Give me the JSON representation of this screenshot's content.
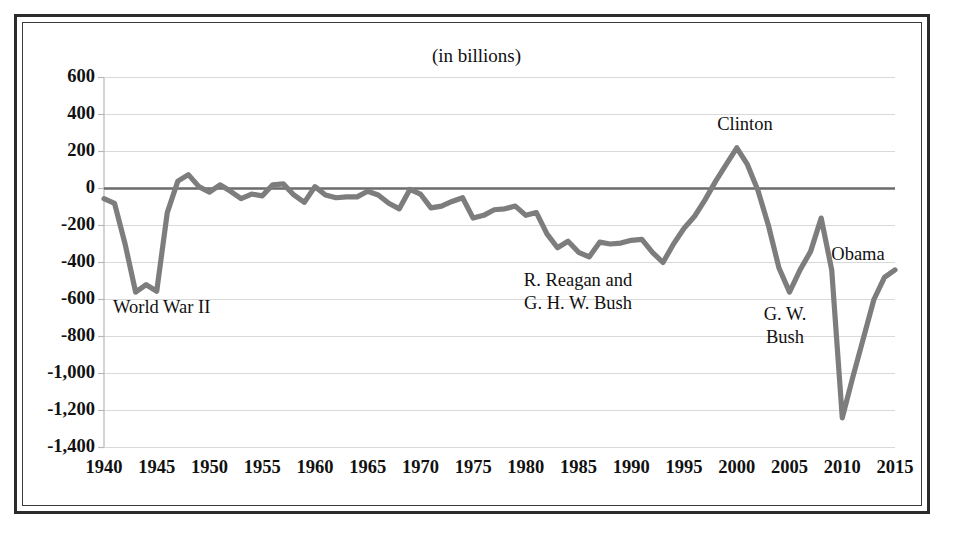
{
  "chart_data": {
    "type": "line",
    "title": "(in billions)",
    "xlabel": "",
    "ylabel": "",
    "xlim": [
      1940,
      2015
    ],
    "ylim": [
      -1400,
      600
    ],
    "grid": true,
    "legend": "none",
    "ytick_labels": [
      "600",
      "400",
      "200",
      "0",
      "-200",
      "-400",
      "-600",
      "-800",
      "-1,000",
      "-1,200",
      "-1,400"
    ],
    "ytick_values": [
      600,
      400,
      200,
      0,
      -200,
      -400,
      -600,
      -800,
      -1000,
      -1200,
      -1400
    ],
    "xtick_labels": [
      "1940",
      "1945",
      "1950",
      "1955",
      "1960",
      "1965",
      "1970",
      "1975",
      "1980",
      "1985",
      "1990",
      "1995",
      "2000",
      "2005",
      "2010",
      "2015"
    ],
    "xtick_values": [
      1940,
      1945,
      1950,
      1955,
      1960,
      1965,
      1970,
      1975,
      1980,
      1985,
      1990,
      1995,
      2000,
      2005,
      2010,
      2015
    ],
    "series": [
      {
        "name": "Federal surplus or deficit",
        "color": "#7d7d7d",
        "x": [
          1940,
          1941,
          1942,
          1943,
          1944,
          1945,
          1946,
          1947,
          1948,
          1949,
          1950,
          1951,
          1952,
          1953,
          1954,
          1955,
          1956,
          1957,
          1958,
          1959,
          1960,
          1961,
          1962,
          1963,
          1964,
          1965,
          1966,
          1967,
          1968,
          1969,
          1970,
          1971,
          1972,
          1973,
          1974,
          1975,
          1976,
          1977,
          1978,
          1979,
          1980,
          1981,
          1982,
          1983,
          1984,
          1985,
          1986,
          1987,
          1988,
          1989,
          1990,
          1991,
          1992,
          1993,
          1994,
          1995,
          1996,
          1997,
          1998,
          1999,
          2000,
          2001,
          2002,
          2003,
          2004,
          2005,
          2006,
          2007,
          2008,
          2009,
          2010,
          2011,
          2012,
          2013,
          2014,
          2015
        ],
        "values": [
          -55,
          -80,
          -300,
          -560,
          -520,
          -555,
          -130,
          40,
          75,
          10,
          -20,
          20,
          -15,
          -55,
          -30,
          -40,
          20,
          25,
          -35,
          -75,
          10,
          -35,
          -50,
          -45,
          -45,
          -15,
          -35,
          -80,
          -110,
          -5,
          -30,
          -105,
          -95,
          -70,
          -50,
          -160,
          -145,
          -115,
          -110,
          -95,
          -145,
          -130,
          -245,
          -320,
          -285,
          -345,
          -370,
          -290,
          -300,
          -295,
          -280,
          -275,
          -345,
          -400,
          -300,
          -215,
          -150,
          -60,
          40,
          130,
          220,
          130,
          -10,
          -200,
          -430,
          -560,
          -440,
          -340,
          -160,
          -440,
          -1240,
          -1020,
          -810,
          -600,
          -480,
          -440
        ]
      }
    ],
    "annotations": [
      {
        "id": "ww2",
        "lines": [
          "World War II"
        ]
      },
      {
        "id": "reagan-bush",
        "lines": [
          "R. Reagan and",
          "G. H. W. Bush"
        ]
      },
      {
        "id": "clinton",
        "lines": [
          "Clinton"
        ]
      },
      {
        "id": "gw-bush",
        "lines": [
          "G. W.",
          "Bush"
        ]
      },
      {
        "id": "obama",
        "lines": [
          "Obama"
        ]
      }
    ]
  },
  "style": {
    "line_color": "#7d7d7d",
    "zero_line_color": "#6b6b6b",
    "grid_color": "#d9d9d9",
    "axis_color": "#b8b8b8",
    "text_color": "#111111",
    "frame_color": "#2b2b2b",
    "background": "#ffffff"
  }
}
